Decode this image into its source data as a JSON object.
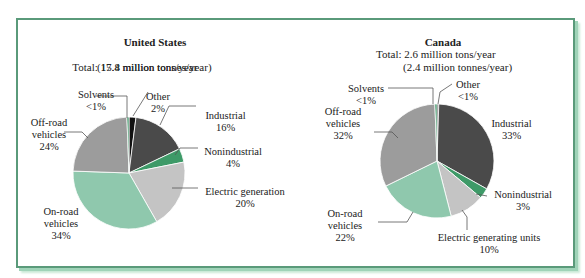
{
  "chart_data": [
    {
      "type": "pie",
      "title": "United States",
      "subtitle": [
        "Total: 17.4 million tons/year",
        "(15.8 million tonnes/year)"
      ],
      "slices": [
        {
          "name": "Other",
          "label": "2%",
          "value": 2,
          "color": "#111111"
        },
        {
          "name": "Industrial",
          "label": "16%",
          "value": 16,
          "color": "#4a4a4a"
        },
        {
          "name": "Nonindustrial",
          "label": "4%",
          "value": 4,
          "color": "#3e9a68"
        },
        {
          "name": "Electric generation",
          "label": "20%",
          "value": 20,
          "color": "#c4c4c4"
        },
        {
          "name": "On-road vehicles",
          "label": "34%",
          "value": 34,
          "color": "#8fc8ad"
        },
        {
          "name": "Off-road vehicles",
          "label": "24%",
          "value": 24,
          "color": "#9c9c9c"
        },
        {
          "name": "Solvents",
          "label": "<1%",
          "value": 0.6,
          "color": "#2f8a5a"
        }
      ]
    },
    {
      "type": "pie",
      "title": "Canada",
      "subtitle": [
        "Total: 2.6 million tons/year",
        "(2.4 million tonnes/year)"
      ],
      "slices": [
        {
          "name": "Other",
          "label": "<1%",
          "value": 0.5,
          "color": "#111111"
        },
        {
          "name": "Industrial",
          "label": "33%",
          "value": 33,
          "color": "#4a4a4a"
        },
        {
          "name": "Nonindustrial",
          "label": "3%",
          "value": 3,
          "color": "#3e9a68"
        },
        {
          "name": "Electric generating units",
          "label": "10%",
          "value": 10,
          "color": "#c4c4c4"
        },
        {
          "name": "On-road vehicles",
          "label": "22%",
          "value": 22,
          "color": "#8fc8ad"
        },
        {
          "name": "Off-road vehicles",
          "label": "32%",
          "value": 32,
          "color": "#9c9c9c"
        },
        {
          "name": "Solvents",
          "label": "<1%",
          "value": 0.6,
          "color": "#2f8a5a"
        }
      ]
    }
  ],
  "us": {
    "title": "United States",
    "total_line1": "Total: 17.4 million tons/year",
    "total_line2": "(15.8 million tonnes/year)",
    "labels": {
      "solvents": "Solvents",
      "solvents_pct": "<1%",
      "other": "Other",
      "other_pct": "2%",
      "industrial": "Industrial",
      "industrial_pct": "16%",
      "offroad1": "Off-road",
      "offroad2": "vehicles",
      "offroad_pct": "24%",
      "nonind": "Nonindustrial",
      "nonind_pct": "4%",
      "elec": "Electric generation",
      "elec_pct": "20%",
      "onroad1": "On-road",
      "onroad2": "vehicles",
      "onroad_pct": "34%"
    }
  },
  "ca": {
    "title": "Canada",
    "total_line1": "Total: 2.6 million tons/year",
    "total_line2": "(2.4 million tonnes/year)",
    "labels": {
      "solvents": "Solvents",
      "solvents_pct": "<1%",
      "other": "Other",
      "other_pct": "<1%",
      "industrial": "Industrial",
      "industrial_pct": "33%",
      "offroad1": "Off-road",
      "offroad2": "vehicles",
      "offroad_pct": "32%",
      "nonind": "Nonindustrial",
      "nonind_pct": "3%",
      "elec": "Electric generating units",
      "elec_pct": "10%",
      "onroad1": "On-road",
      "onroad2": "vehicles",
      "onroad_pct": "22%"
    }
  }
}
